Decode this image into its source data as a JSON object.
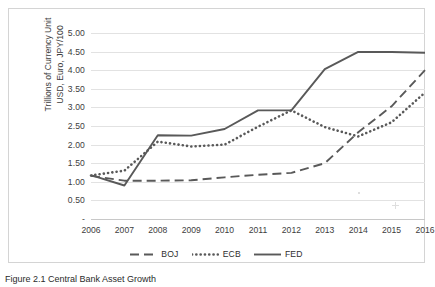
{
  "figure": {
    "caption": "Figure 2.1   Central Bank Asset Growth"
  },
  "chart_data": {
    "type": "line",
    "title": "",
    "xlabel": "",
    "ylabel": "Trillions of Currency Unit USD, Euro, JPY/100",
    "ylabel_line1": "Trillions of Currency Unit",
    "ylabel_line2": "USD, Euro, JPY/100",
    "categories": [
      "2006",
      "2007",
      "2008",
      "2009",
      "2010",
      "2011",
      "2012",
      "2013",
      "2014",
      "2015",
      "2016"
    ],
    "x": [
      2006,
      2007,
      2008,
      2009,
      2010,
      2011,
      2012,
      2013,
      2014,
      2015,
      2016
    ],
    "ylim": [
      0,
      5.0
    ],
    "yticks": [
      "-",
      "0.50",
      "1.00",
      "1.50",
      "2.00",
      "2.50",
      "3.00",
      "3.50",
      "4.00",
      "4.50",
      "5.00"
    ],
    "ytick_values": [
      0,
      0.5,
      1.0,
      1.5,
      2.0,
      2.5,
      3.0,
      3.5,
      4.0,
      4.5,
      5.0
    ],
    "grid": true,
    "legend_position": "bottom",
    "series": [
      {
        "name": "BOJ",
        "style": "dashed",
        "color": "#595959",
        "values": [
          1.16,
          1.03,
          1.03,
          1.04,
          1.12,
          1.19,
          1.24,
          1.5,
          2.33,
          3.03,
          4.0
        ]
      },
      {
        "name": "ECB",
        "style": "dotted",
        "color": "#595959",
        "values": [
          1.17,
          1.3,
          2.08,
          1.95,
          2.0,
          2.48,
          2.92,
          2.47,
          2.22,
          2.6,
          3.4
        ]
      },
      {
        "name": "FED",
        "style": "solid",
        "color": "#595959",
        "values": [
          1.18,
          0.9,
          2.25,
          2.24,
          2.42,
          2.92,
          2.92,
          4.03,
          4.49,
          4.49,
          4.47
        ]
      }
    ]
  },
  "legend": {
    "items": [
      {
        "label": "BOJ",
        "marker": "dashed-line-swatch"
      },
      {
        "label": "ECB",
        "marker": "dotted-line-swatch"
      },
      {
        "label": "FED",
        "marker": "solid-line-swatch"
      }
    ]
  }
}
